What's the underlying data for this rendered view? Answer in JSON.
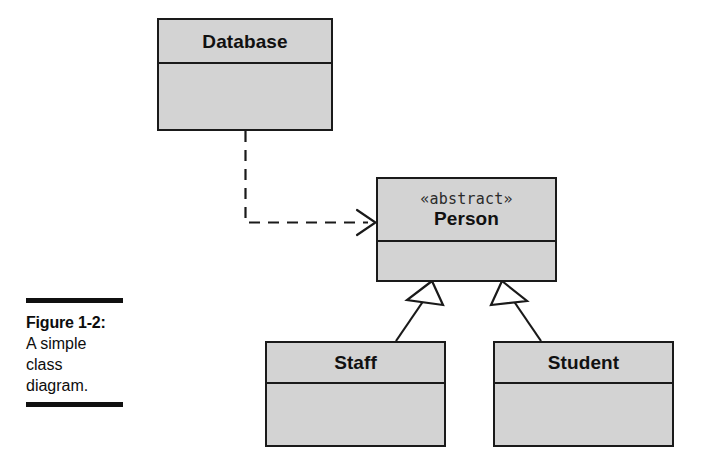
{
  "figure": {
    "caption_label": "Figure 1-2:",
    "caption_lines": [
      "A simple",
      "class",
      "diagram."
    ]
  },
  "diagram": {
    "type": "uml-class-diagram",
    "classes": [
      {
        "id": "database",
        "name": "Database",
        "stereotype": "",
        "attributes": [],
        "operations": []
      },
      {
        "id": "person",
        "name": "Person",
        "stereotype": "«abstract»",
        "attributes": [],
        "operations": []
      },
      {
        "id": "staff",
        "name": "Staff",
        "stereotype": "",
        "attributes": [],
        "operations": []
      },
      {
        "id": "student",
        "name": "Student",
        "stereotype": "",
        "attributes": [],
        "operations": []
      }
    ],
    "relationships": [
      {
        "id": "database-to-person",
        "kind": "dependency",
        "line_style": "dashed",
        "arrowhead": "open",
        "from": "Database",
        "to": "Person",
        "label": ""
      },
      {
        "id": "staff-to-person",
        "kind": "generalization",
        "line_style": "solid",
        "arrowhead": "hollow-triangle",
        "from": "Staff",
        "to": "Person",
        "label": ""
      },
      {
        "id": "student-to-person",
        "kind": "generalization",
        "line_style": "solid",
        "arrowhead": "hollow-triangle",
        "from": "Student",
        "to": "Person",
        "label": ""
      }
    ]
  },
  "colors": {
    "box_fill": "#d3d3d3",
    "stroke": "#1a1a1a",
    "text": "#111111",
    "page_background": "#ffffff",
    "rule": "#101010"
  }
}
